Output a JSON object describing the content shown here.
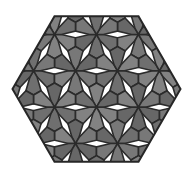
{
  "figure": {
    "name": "hexagonal-pinwheel-tiling",
    "canvas": {
      "width": 193,
      "height": 178
    },
    "background_color": "#ffffff"
  },
  "palette": {
    "tile_fill": "#787878",
    "tile_fill_alt": "#6f6f6f",
    "tile_fill_dark": "#676767",
    "tile_fill_light": "#828282",
    "edge_color": "#2b2b2b",
    "outline_color": "#262626",
    "background": "#ffffff"
  },
  "geometry": {
    "hexagon": {
      "center_x": 96.5,
      "center_y": 89.0,
      "circumradius": 84.0,
      "orientation": "flat-top",
      "vertices": [
        [
          12.5,
          89.0
        ],
        [
          54.5,
          16.25
        ],
        [
          138.5,
          16.25
        ],
        [
          180.5,
          89.0
        ],
        [
          138.5,
          161.75
        ],
        [
          54.5,
          161.75
        ]
      ]
    },
    "lattice": {
      "type": "triangular",
      "cell_edge": 42.0,
      "rows": 4,
      "cols": 4,
      "motif": "three-fold pinwheel of elongated hexagons",
      "tiles_per_cell": 3
    },
    "stroke_width": 1.6,
    "outline_stroke_width": 2.0
  },
  "motif": {
    "name": "pinwheel-triangle-cell",
    "description": "Each triangular lattice cell holds three congruent elongated-hexagon tiles arranged with 120 degree rotational symmetry around the cell centroid.",
    "tile_shape": "elongated hexagon",
    "rotational_order": 3
  }
}
